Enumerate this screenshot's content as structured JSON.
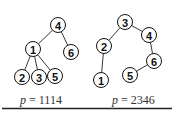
{
  "trees": [
    {
      "caption_var": "p",
      "caption_eq": " = ",
      "caption_value": "1114",
      "nodes": [
        {
          "id": "4",
          "label": "4",
          "x": 58,
          "y": 25
        },
        {
          "id": "1",
          "label": "1",
          "x": 33,
          "y": 49
        },
        {
          "id": "6",
          "label": "6",
          "x": 71,
          "y": 52
        },
        {
          "id": "2",
          "label": "2",
          "x": 22,
          "y": 77
        },
        {
          "id": "3",
          "label": "3",
          "x": 39,
          "y": 77
        },
        {
          "id": "5",
          "label": "5",
          "x": 55,
          "y": 76
        }
      ],
      "edges": [
        [
          "4",
          "1"
        ],
        [
          "4",
          "6"
        ],
        [
          "1",
          "2"
        ],
        [
          "1",
          "3"
        ],
        [
          "1",
          "5"
        ]
      ]
    },
    {
      "caption_var": "p",
      "caption_eq": " = ",
      "caption_value": "2346",
      "nodes": [
        {
          "id": "3",
          "label": "3",
          "x": 125,
          "y": 22
        },
        {
          "id": "4",
          "label": "4",
          "x": 149,
          "y": 35
        },
        {
          "id": "2",
          "label": "2",
          "x": 104,
          "y": 46
        },
        {
          "id": "6",
          "label": "6",
          "x": 154,
          "y": 61
        },
        {
          "id": "1",
          "label": "1",
          "x": 101,
          "y": 80
        },
        {
          "id": "5",
          "label": "5",
          "x": 130,
          "y": 75
        }
      ],
      "edges": [
        [
          "3",
          "2"
        ],
        [
          "3",
          "4"
        ],
        [
          "4",
          "6"
        ],
        [
          "6",
          "5"
        ],
        [
          "2",
          "1"
        ]
      ]
    }
  ],
  "style": {
    "node_radius": 7.5,
    "line_color": "#111111",
    "rule_color": "#222222"
  }
}
